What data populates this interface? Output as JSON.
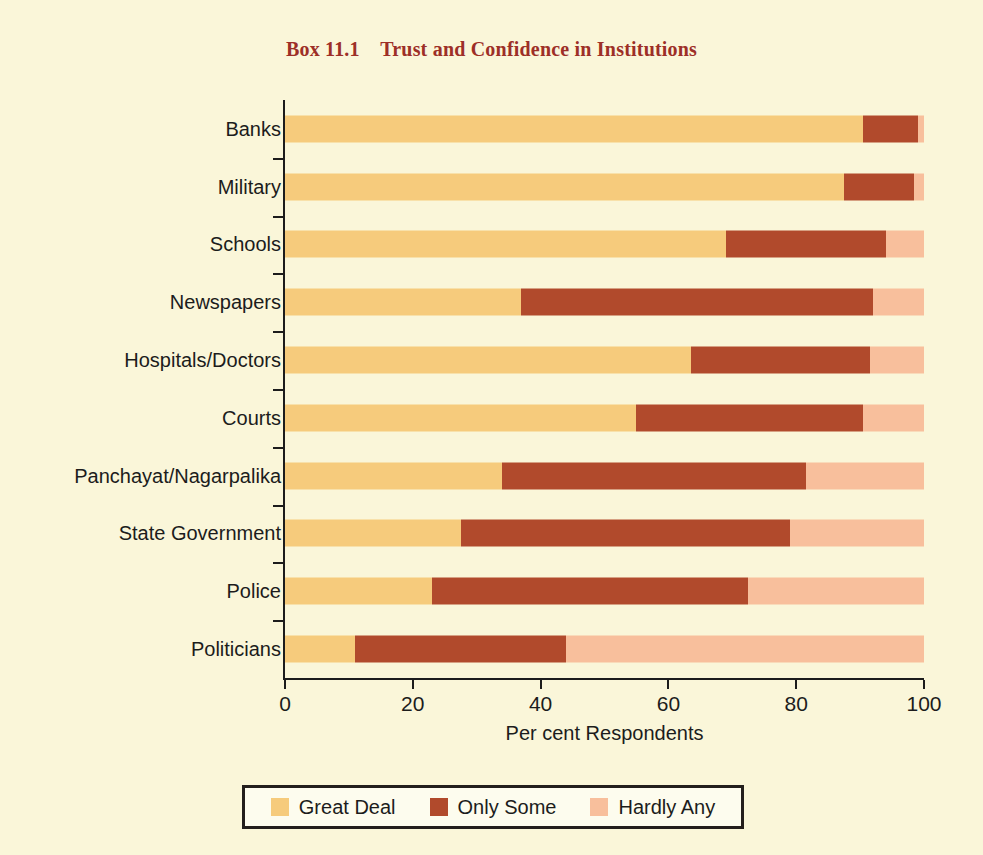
{
  "title": "Box 11.1    Trust and Confidence in Institutions",
  "background_color": "#faf6d9",
  "title_color": "#9d2f27",
  "axis": {
    "xlabel": "Per cent Respondents",
    "xticks": [
      "0",
      "20",
      "40",
      "60",
      "80",
      "100"
    ]
  },
  "legend": {
    "items": [
      {
        "label": "Great Deal",
        "color": "#f6cb7c"
      },
      {
        "label": "Only Some",
        "color": "#b14a2c"
      },
      {
        "label": "Hardly Any",
        "color": "#f8bf9c"
      }
    ]
  },
  "chart_data": {
    "type": "bar",
    "orientation": "horizontal",
    "stacked": true,
    "stack_mode": "percent",
    "title": "Box 11.1    Trust and Confidence in Institutions",
    "xlabel": "Per cent Respondents",
    "ylabel": "",
    "xlim": [
      0,
      100
    ],
    "xticks": [
      0,
      20,
      40,
      60,
      80,
      100
    ],
    "grid": false,
    "legend_position": "bottom",
    "categories": [
      "Banks",
      "Military",
      "Schools",
      "Newspapers",
      "Hospitals/Doctors",
      "Courts",
      "Panchayat/Nagarpalika",
      "State Government",
      "Police",
      "Politicians"
    ],
    "series": [
      {
        "name": "Great Deal",
        "color": "#f6cb7c",
        "values": [
          90.5,
          87.5,
          69,
          37,
          63.5,
          55,
          34,
          27.5,
          23,
          11
        ]
      },
      {
        "name": "Only Some",
        "color": "#b14a2c",
        "values": [
          8.5,
          11,
          25,
          55,
          28,
          35.5,
          47.5,
          51.5,
          49.5,
          33
        ]
      },
      {
        "name": "Hardly Any",
        "color": "#f8bf9c",
        "values": [
          1,
          1.5,
          6,
          8,
          8.5,
          9.5,
          18.5,
          21,
          27.5,
          56
        ]
      }
    ]
  }
}
